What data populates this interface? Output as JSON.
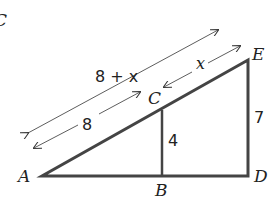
{
  "diagram": {
    "type": "similar-triangles",
    "points": {
      "A": "A",
      "B": "B",
      "C": "C",
      "D": "D",
      "E": "E"
    },
    "labels": {
      "AC": "8",
      "CE": "x",
      "AE": "8 + x",
      "BC": "4",
      "DE": "7"
    },
    "corner_fragment": "C",
    "colors": {
      "stroke": "#444444",
      "text": "#222222",
      "arrow": "#333333"
    }
  }
}
